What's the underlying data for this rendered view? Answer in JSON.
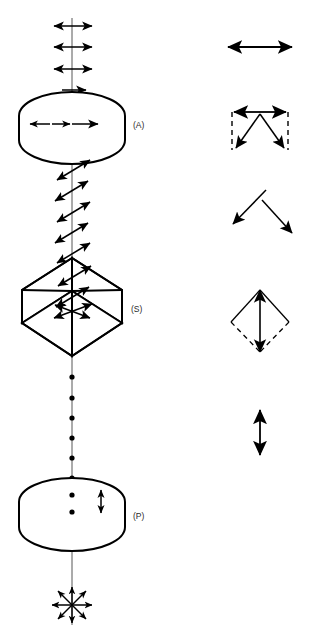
{
  "figure": {
    "background_color": "#ffffff",
    "stroke_color": "#000000",
    "label_color": "#2a2a2a",
    "width": 309,
    "height": 640
  },
  "components": [
    {
      "id": "A",
      "label": "(A)",
      "name": "analyzer-disc",
      "shape": "cylinder",
      "label_x": 133,
      "label_y": 128,
      "center_x": 72,
      "center_y": 128
    },
    {
      "id": "S",
      "label": "(S)",
      "name": "sample-cube",
      "shape": "rhombohedron",
      "label_x": 131,
      "label_y": 312,
      "center_x": 72,
      "center_y": 305
    },
    {
      "id": "P",
      "label": "(P)",
      "name": "polarizer-disc",
      "shape": "cylinder",
      "label_x": 133,
      "label_y": 519,
      "center_x": 72,
      "center_y": 515
    }
  ],
  "beam_axis": {
    "name": "optical-axis",
    "x": 72,
    "y_top": 18,
    "y_bottom": 625
  },
  "polarization_stages": [
    {
      "name": "horizontal-linear-above-analyzer",
      "symbol": "horizontal-double-arrow",
      "count": 3,
      "description": "Horizontal linear polarization exiting the analyzer"
    },
    {
      "name": "horizontal-linear-inside-analyzer",
      "symbol": "horizontal-double-arrow",
      "count": 2,
      "description": "Horizontal component inside the analyzer disc"
    },
    {
      "name": "rotated-linear-between-analyzer-and-sample",
      "symbol": "tilted-double-arrow",
      "count": 5,
      "angle_degrees": -35,
      "description": "Rotated linear polarization between sample and analyzer"
    },
    {
      "name": "rotated-linear-inside-sample",
      "symbol": "tilted-double-arrow",
      "count": 3,
      "angle_degrees": -35,
      "description": "Optical rotation occurring inside the sample"
    },
    {
      "name": "vertical-linear-between-sample-and-polarizer",
      "symbol": "axial-dot",
      "count": 6,
      "description": "Vertically polarized beam shown end-on as dots"
    },
    {
      "name": "vertical-linear-inside-polarizer",
      "symbol": "vertical-double-arrow",
      "count": 1,
      "description": "Vertical linear polarization transmitted by the polarizer"
    },
    {
      "name": "unpolarized-source",
      "symbol": "eight-ray-starburst",
      "count": 1,
      "description": "Unpolarized light entering the polarizer"
    }
  ],
  "legend": [
    {
      "index": 1,
      "name": "legend-horizontal-double-arrow",
      "symbol": "horizontal-double-arrow",
      "cx": 260,
      "cy": 47,
      "description": "Linear polarization, horizontal"
    },
    {
      "index": 2,
      "name": "legend-horizontal-resolved-components",
      "symbol": "horizontal-arrow-with-dashed-box-and-v-components",
      "cx": 260,
      "cy": 130,
      "description": "Horizontal vector resolved into two diagonal components"
    },
    {
      "index": 3,
      "name": "legend-diagonal-component-pair",
      "symbol": "inverted-v-diagonal-arrows",
      "cx": 260,
      "cy": 212,
      "description": "Two diagonal component vectors"
    },
    {
      "index": 4,
      "name": "legend-vertical-resultant",
      "symbol": "diamond-with-vertical-double-arrow",
      "cx": 260,
      "cy": 320,
      "description": "Diagonal components recombining into a vertical resultant"
    },
    {
      "index": 5,
      "name": "legend-vertical-double-arrow",
      "symbol": "vertical-double-arrow",
      "cx": 260,
      "cy": 432,
      "description": "Linear polarization, vertical"
    }
  ]
}
